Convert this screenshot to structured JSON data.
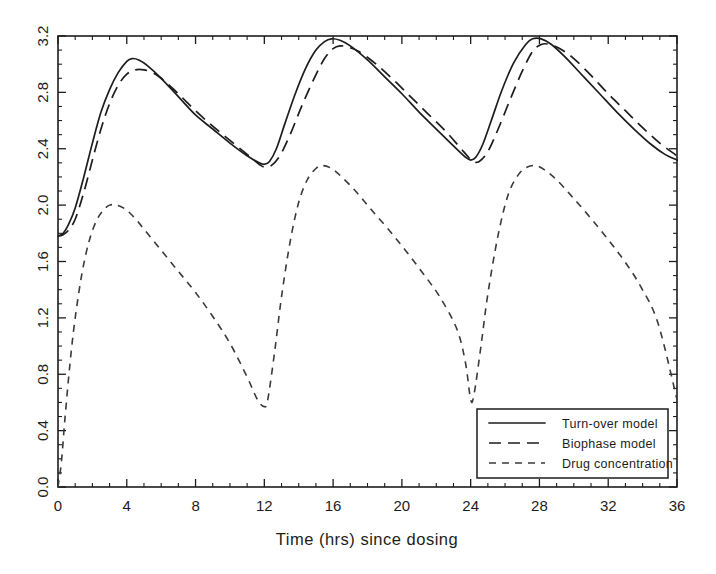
{
  "chart_data": {
    "type": "line",
    "title": "",
    "xlabel": "Time (hrs) since dosing",
    "ylabel": "",
    "xlim": [
      0,
      36
    ],
    "ylim": [
      0.0,
      3.2
    ],
    "xticks": [
      0,
      4,
      8,
      12,
      16,
      20,
      24,
      28,
      32,
      36
    ],
    "xticklabels": [
      "0",
      "4",
      "8",
      "12",
      "16",
      "20",
      "24",
      "28",
      "32",
      "36"
    ],
    "x_minor_interval": 1,
    "yticks": [
      0.0,
      0.4,
      0.8,
      1.2,
      1.6,
      2.0,
      2.4,
      2.8,
      3.2
    ],
    "yticklabels": [
      "0.0",
      "0.4",
      "0.8",
      "1.2",
      "1.6",
      "2.0",
      "2.4",
      "2.8",
      "3.2"
    ],
    "y_minor_interval": 0.1,
    "grid": false,
    "legend_position": "lower right",
    "ytick_label_rotation": 90,
    "series": [
      {
        "name": "Turn-over model",
        "style": "solid",
        "color": "#1d1d1d",
        "x": [
          0.0,
          0.3,
          0.6,
          1.0,
          1.5,
          2.0,
          2.5,
          3.0,
          3.5,
          4.0,
          4.3,
          4.7,
          5.2,
          6.0,
          7.0,
          8.0,
          9.0,
          10.0,
          11.0,
          11.7,
          12.0,
          12.3,
          12.7,
          13.2,
          13.8,
          14.4,
          15.0,
          15.5,
          15.9,
          16.4,
          17.0,
          18.0,
          19.0,
          20.0,
          21.0,
          22.0,
          23.0,
          23.7,
          24.0,
          24.3,
          24.7,
          25.2,
          25.8,
          26.5,
          27.2,
          27.6,
          28.1,
          28.7,
          29.5,
          30.5,
          31.5,
          32.5,
          33.5,
          34.5,
          35.3,
          36.0
        ],
        "y": [
          1.78,
          1.8,
          1.86,
          1.98,
          2.2,
          2.44,
          2.66,
          2.82,
          2.94,
          3.02,
          3.04,
          3.03,
          2.99,
          2.9,
          2.77,
          2.64,
          2.54,
          2.44,
          2.35,
          2.3,
          2.29,
          2.31,
          2.4,
          2.58,
          2.79,
          2.97,
          3.1,
          3.16,
          3.18,
          3.17,
          3.13,
          3.03,
          2.91,
          2.79,
          2.66,
          2.54,
          2.42,
          2.34,
          2.32,
          2.34,
          2.43,
          2.6,
          2.81,
          3.01,
          3.14,
          3.18,
          3.18,
          3.14,
          3.05,
          2.92,
          2.79,
          2.66,
          2.54,
          2.43,
          2.36,
          2.32
        ]
      },
      {
        "name": "Biophase model",
        "style": "long-dash",
        "color": "#1d1d1d",
        "x": [
          0.0,
          0.3,
          0.6,
          1.0,
          1.5,
          2.0,
          2.5,
          3.0,
          3.5,
          4.0,
          4.5,
          5.0,
          5.5,
          6.0,
          7.0,
          8.0,
          9.0,
          10.0,
          11.0,
          11.7,
          12.0,
          12.4,
          12.9,
          13.5,
          14.2,
          14.9,
          15.5,
          16.0,
          16.4,
          16.9,
          17.5,
          18.5,
          19.5,
          20.5,
          21.5,
          22.5,
          23.3,
          23.8,
          24.1,
          24.5,
          25.0,
          25.6,
          26.3,
          27.0,
          27.6,
          28.1,
          28.6,
          29.2,
          30.0,
          31.0,
          32.0,
          33.0,
          34.0,
          35.0,
          36.0
        ],
        "y": [
          1.78,
          1.79,
          1.82,
          1.9,
          2.09,
          2.32,
          2.54,
          2.72,
          2.85,
          2.93,
          2.96,
          2.96,
          2.94,
          2.9,
          2.79,
          2.67,
          2.56,
          2.46,
          2.36,
          2.29,
          2.27,
          2.28,
          2.35,
          2.5,
          2.71,
          2.9,
          3.04,
          3.11,
          3.13,
          3.12,
          3.09,
          3.0,
          2.89,
          2.77,
          2.65,
          2.53,
          2.42,
          2.35,
          2.31,
          2.31,
          2.38,
          2.54,
          2.75,
          2.95,
          3.09,
          3.14,
          3.14,
          3.11,
          3.04,
          2.92,
          2.79,
          2.67,
          2.55,
          2.44,
          2.35
        ]
      },
      {
        "name": "Drug concentration",
        "style": "short-dash",
        "color": "#3a3a3a",
        "x": [
          0.0,
          0.2,
          0.4,
          0.7,
          1.0,
          1.4,
          1.8,
          2.2,
          2.6,
          3.0,
          3.4,
          3.8,
          4.3,
          5.0,
          6.0,
          7.0,
          8.0,
          9.0,
          10.0,
          11.0,
          11.6,
          12.0,
          12.2,
          12.6,
          13.0,
          13.5,
          14.0,
          14.5,
          15.0,
          15.4,
          15.9,
          16.5,
          17.3,
          18.2,
          19.2,
          20.2,
          21.2,
          22.2,
          23.2,
          23.7,
          24.0,
          24.2,
          24.6,
          25.0,
          25.6,
          26.2,
          26.8,
          27.3,
          27.8,
          28.3,
          29.0,
          29.9,
          30.9,
          31.9,
          32.9,
          33.9,
          34.9,
          36.0
        ],
        "y": [
          0.0,
          0.18,
          0.48,
          0.88,
          1.2,
          1.52,
          1.74,
          1.88,
          1.96,
          2.0,
          2.0,
          1.98,
          1.93,
          1.83,
          1.68,
          1.53,
          1.38,
          1.21,
          1.02,
          0.78,
          0.62,
          0.57,
          0.62,
          0.96,
          1.35,
          1.74,
          2.02,
          2.18,
          2.26,
          2.28,
          2.26,
          2.2,
          2.1,
          1.97,
          1.83,
          1.68,
          1.52,
          1.35,
          1.12,
          0.88,
          0.62,
          0.66,
          1.0,
          1.37,
          1.79,
          2.08,
          2.22,
          2.27,
          2.28,
          2.25,
          2.18,
          2.06,
          1.92,
          1.77,
          1.61,
          1.42,
          1.16,
          0.62
        ]
      }
    ]
  },
  "axis": {
    "xlabel": "Time (hrs) since dosing"
  },
  "legend": {
    "items": [
      {
        "label": "Turn-over model",
        "style": "solid"
      },
      {
        "label": "Biophase model",
        "style": "long-dash"
      },
      {
        "label": "Drug concentration",
        "style": "short-dash"
      }
    ]
  },
  "colors": {
    "ink": "#1d1d1d",
    "drug": "#3a3a3a",
    "background": "#ffffff"
  }
}
